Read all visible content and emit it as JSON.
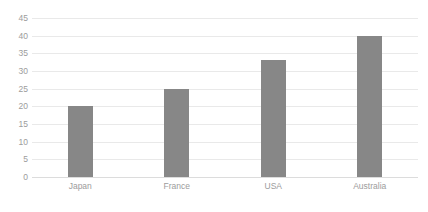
{
  "chart_data": {
    "type": "bar",
    "title": "",
    "subtitle": "",
    "xlabel": "",
    "ylabel": "",
    "categories": [
      "Japan",
      "France",
      "USA",
      "Australia"
    ],
    "values": [
      20,
      25,
      33,
      40
    ],
    "series": [
      {
        "name": "Series 1",
        "values": [
          20,
          25,
          33,
          40
        ]
      }
    ],
    "ylim": [
      0,
      45
    ],
    "ytick_step": 5,
    "yticks": [
      45,
      40,
      35,
      30,
      25,
      20,
      15,
      10,
      5,
      0
    ],
    "ytick_labels": [
      "45",
      "40",
      "35",
      "30",
      "25",
      "20",
      "15",
      "10",
      "5",
      "0"
    ],
    "grid": true,
    "grid_axis": "y",
    "legend": false,
    "legend_position": "none",
    "annotations": [],
    "colors": {
      "bar": "#878787",
      "gridline": "#e9e9e9",
      "baseline": "#dcdcdc",
      "tick_label": "#9c9c9c",
      "background": "#ffffff"
    }
  }
}
